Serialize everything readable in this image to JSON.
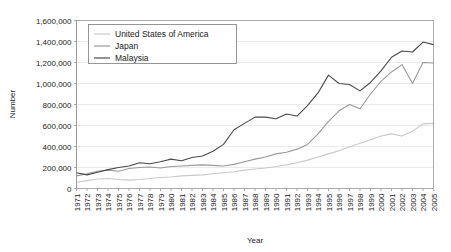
{
  "chart_data": {
    "type": "line",
    "title": "",
    "xlabel": "Year",
    "ylabel": "Number",
    "ylim": [
      0,
      1600000
    ],
    "ytick_labels": [
      "0",
      "200,000",
      "400,000",
      "600,000",
      "800,000",
      "1,000,000",
      "1,200,000",
      "1,400,000",
      "1,600,000"
    ],
    "ytick_values": [
      0,
      200000,
      400000,
      600000,
      800000,
      1000000,
      1200000,
      1400000,
      1600000
    ],
    "grid": true,
    "legend_position": "top-left-inside",
    "x": [
      1971,
      1972,
      1973,
      1974,
      1975,
      1976,
      1977,
      1978,
      1979,
      1980,
      1981,
      1982,
      1983,
      1984,
      1985,
      1986,
      1987,
      1988,
      1989,
      1990,
      1991,
      1992,
      1993,
      1994,
      1995,
      1996,
      1997,
      1998,
      1999,
      2000,
      2001,
      2002,
      2003,
      2004,
      2005
    ],
    "xtick_labels": [
      "1971",
      "1972",
      "1973",
      "1974",
      "1975",
      "1976",
      "1977",
      "1978",
      "1979",
      "1980",
      "1981",
      "1982",
      "1983",
      "1984",
      "1985",
      "1986",
      "1987",
      "1988",
      "1989",
      "1990",
      "1991",
      "1992",
      "1993",
      "1994",
      "1995",
      "1996",
      "1997",
      "1998",
      "1999",
      "2000",
      "2001",
      "2002",
      "2003",
      "2004",
      "2005"
    ],
    "series": [
      {
        "name": "United States of America",
        "color": "#c9c9c9",
        "values": [
          60000,
          75000,
          90000,
          95000,
          85000,
          80000,
          85000,
          95000,
          105000,
          110000,
          120000,
          125000,
          130000,
          140000,
          150000,
          160000,
          175000,
          185000,
          195000,
          210000,
          225000,
          245000,
          270000,
          300000,
          330000,
          360000,
          395000,
          430000,
          465000,
          500000,
          520000,
          500000,
          545000,
          615000,
          620000
        ]
      },
      {
        "name": "Japan",
        "color": "#9a9a9a",
        "values": [
          120000,
          140000,
          165000,
          175000,
          165000,
          190000,
          200000,
          205000,
          195000,
          210000,
          215000,
          220000,
          225000,
          220000,
          215000,
          230000,
          255000,
          280000,
          300000,
          330000,
          345000,
          375000,
          420000,
          520000,
          640000,
          740000,
          800000,
          760000,
          900000,
          1020000,
          1110000,
          1180000,
          1000000,
          1200000,
          1195000
        ]
      },
      {
        "name": "Malaysia",
        "color": "#4a4a4a",
        "values": [
          150000,
          130000,
          155000,
          180000,
          200000,
          215000,
          245000,
          235000,
          255000,
          280000,
          265000,
          295000,
          310000,
          355000,
          420000,
          560000,
          620000,
          680000,
          680000,
          665000,
          710000,
          690000,
          790000,
          910000,
          1080000,
          1000000,
          990000,
          930000,
          1010000,
          1120000,
          1250000,
          1310000,
          1300000,
          1395000,
          1370000
        ]
      }
    ]
  },
  "legend": {
    "items": [
      {
        "label": "United States of America"
      },
      {
        "label": "Japan"
      },
      {
        "label": "Malaysia"
      }
    ]
  }
}
